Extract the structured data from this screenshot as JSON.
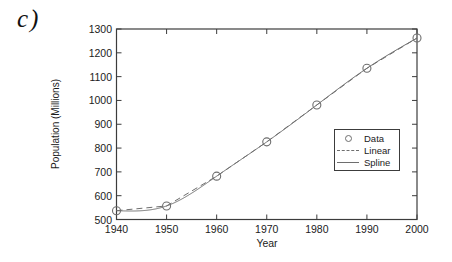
{
  "panel_label": "c)",
  "chart_data": {
    "type": "line",
    "title": "",
    "xlabel": "Year",
    "ylabel": "Population (Millions)",
    "x": [
      1940,
      1950,
      1960,
      1970,
      1980,
      1990,
      2000
    ],
    "series": [
      {
        "name": "Data",
        "render": "scatter-circles",
        "values": [
          537,
          557,
          682,
          826,
          981,
          1135,
          1262
        ]
      },
      {
        "name": "Linear",
        "render": "dashed-line",
        "values": [
          537,
          557,
          682,
          826,
          981,
          1135,
          1262
        ]
      },
      {
        "name": "Spline",
        "render": "cubic-spline",
        "values": [
          537,
          557,
          682,
          826,
          981,
          1135,
          1262
        ]
      }
    ],
    "xlim": [
      1940,
      2000
    ],
    "ylim": [
      500,
      1300
    ],
    "xticks": [
      1940,
      1950,
      1960,
      1970,
      1980,
      1990,
      2000
    ],
    "yticks": [
      500,
      600,
      700,
      800,
      900,
      1000,
      1100,
      1200,
      1300
    ],
    "grid": false,
    "tick_direction": "in",
    "legend": {
      "position": "inside-right",
      "entries": [
        "Data",
        "Linear",
        "Spline"
      ]
    },
    "colors": {
      "line": "#6e6e6e",
      "axis": "#3c3c3c",
      "text": "#1b1b1b",
      "background": "#ffffff"
    }
  }
}
